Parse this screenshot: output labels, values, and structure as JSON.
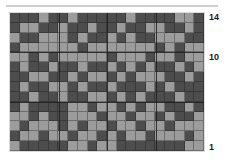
{
  "chart_title": "",
  "top_rule": "horizontal-divider",
  "colors": {
    "dark": "#4d4d4d",
    "light": "#9c9c9c",
    "gridline": "#141414",
    "bold_gridline": "#1d1d1d",
    "rule": "#d0d0d0",
    "label_text": "#1a1a1a",
    "background": "#ffffff"
  },
  "chart_data": {
    "type": "heatmap",
    "title": "",
    "xlabel": "",
    "ylabel": "",
    "columns": 20,
    "rows": 14,
    "grid": true,
    "legend": "none",
    "value_labels": {
      "0": "dark",
      "1": "light"
    },
    "row_labels": [
      {
        "row": 14,
        "text": "14"
      },
      {
        "row": 10,
        "text": "10"
      },
      {
        "row": 1,
        "text": "1"
      }
    ],
    "bold_row_separators": [
      10,
      5
    ],
    "bold_column_separators": [
      5,
      10,
      15
    ],
    "row_order": "top row is 14, bottom row is 1",
    "values": [
      [
        0,
        0,
        0,
        1,
        0,
        0,
        1,
        0,
        0,
        0,
        0,
        0,
        1,
        0,
        0,
        0,
        0,
        1,
        1,
        0
      ],
      [
        0,
        1,
        1,
        0,
        0,
        1,
        0,
        0,
        1,
        0,
        0,
        1,
        0,
        0,
        1,
        1,
        0,
        0,
        1,
        0
      ],
      [
        1,
        0,
        0,
        1,
        1,
        1,
        0,
        1,
        0,
        0,
        1,
        0,
        1,
        0,
        0,
        1,
        1,
        1,
        0,
        0
      ],
      [
        0,
        1,
        1,
        1,
        1,
        1,
        1,
        0,
        1,
        1,
        1,
        1,
        1,
        1,
        1,
        0,
        1,
        0,
        1,
        1
      ],
      [
        1,
        1,
        0,
        1,
        0,
        1,
        1,
        1,
        1,
        1,
        0,
        1,
        1,
        1,
        0,
        1,
        1,
        0,
        1,
        1
      ],
      [
        0,
        1,
        0,
        0,
        1,
        0,
        0,
        1,
        0,
        0,
        1,
        0,
        1,
        0,
        1,
        0,
        0,
        1,
        0,
        1
      ],
      [
        0,
        0,
        1,
        1,
        0,
        0,
        1,
        0,
        1,
        1,
        0,
        1,
        0,
        1,
        1,
        1,
        0,
        0,
        1,
        0
      ],
      [
        0,
        1,
        0,
        0,
        1,
        1,
        0,
        1,
        0,
        0,
        1,
        0,
        0,
        0,
        1,
        0,
        1,
        0,
        0,
        0
      ],
      [
        0,
        0,
        1,
        0,
        0,
        1,
        0,
        0,
        1,
        1,
        0,
        1,
        0,
        1,
        0,
        0,
        0,
        1,
        0,
        0
      ],
      [
        0,
        1,
        0,
        0,
        0,
        0,
        1,
        1,
        0,
        1,
        1,
        0,
        1,
        0,
        1,
        1,
        0,
        0,
        1,
        0
      ],
      [
        1,
        1,
        0,
        1,
        0,
        0,
        1,
        1,
        1,
        0,
        1,
        1,
        0,
        1,
        1,
        0,
        1,
        0,
        0,
        1
      ],
      [
        1,
        0,
        1,
        1,
        1,
        0,
        1,
        0,
        1,
        1,
        0,
        1,
        1,
        0,
        1,
        1,
        0,
        1,
        1,
        1
      ],
      [
        0,
        1,
        1,
        0,
        1,
        1,
        0,
        1,
        1,
        0,
        1,
        0,
        1,
        1,
        0,
        1,
        1,
        1,
        0,
        1
      ],
      [
        1,
        0,
        0,
        0,
        0,
        0,
        1,
        1,
        0,
        1,
        1,
        0,
        0,
        0,
        0,
        0,
        0,
        0,
        1,
        1
      ]
    ]
  }
}
